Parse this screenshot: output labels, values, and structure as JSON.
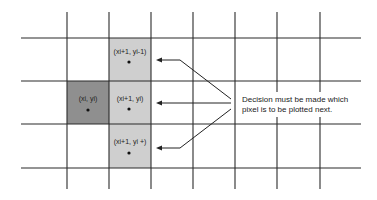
{
  "diagram": {
    "type": "pixel-grid",
    "grid": {
      "columns_x": [
        67,
        109,
        151,
        193,
        235,
        277,
        320
      ],
      "rows_y": [
        38,
        81,
        124,
        168
      ],
      "line_color": "#2b2b2b"
    },
    "colors": {
      "current_pixel": "#8f8f8f",
      "candidate_pixel": "#cfcfcf",
      "text": "#222222"
    },
    "cells": {
      "current": {
        "label": "(xi, yi)",
        "x_sub": "i",
        "y_sub": "i"
      },
      "candidate_top": {
        "label": "(xi+1, yi-1)"
      },
      "candidate_mid": {
        "label": "(xi+1, yi)"
      },
      "candidate_bottom": {
        "label": "(xi+1, yi +)"
      }
    },
    "note": {
      "line1": "Decision must be made which",
      "line2": "pixel is to be plotted next."
    }
  }
}
